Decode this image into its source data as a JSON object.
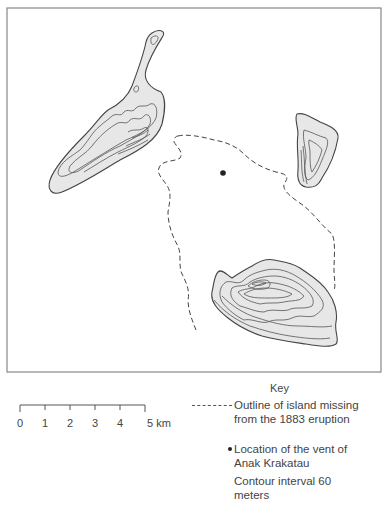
{
  "map": {
    "frame": {
      "x": 7,
      "y": 8,
      "width": 374,
      "height": 364
    },
    "colors": {
      "land": "#e6e7e6",
      "stroke": "#444444",
      "background": "#ffffff"
    },
    "features": [
      {
        "name": "northwest-island",
        "type": "island-with-contours"
      },
      {
        "name": "northeast-island",
        "type": "island-with-contours"
      },
      {
        "name": "south-island",
        "type": "island-with-contours",
        "note": "peak contours near north-west of island"
      },
      {
        "name": "missing-island-outline",
        "type": "dashed-outline"
      },
      {
        "name": "anak-krakatau-vent",
        "type": "point",
        "x": 223,
        "y": 173
      }
    ]
  },
  "scale_bar": {
    "unit": "km",
    "ticks": [
      "0",
      "1",
      "2",
      "3",
      "4",
      "5 km"
    ]
  },
  "key": {
    "title": "Key",
    "items": [
      {
        "symbol": "dashed-line",
        "label_line1": "Outline of island missing",
        "label_line2": "from the 1883 eruption"
      },
      {
        "symbol": "dot",
        "label_line1": "Location of the vent of",
        "label_line2": "Anak Krakatau"
      }
    ],
    "contour_note_line1": "Contour interval 60",
    "contour_note_line2": "meters"
  }
}
